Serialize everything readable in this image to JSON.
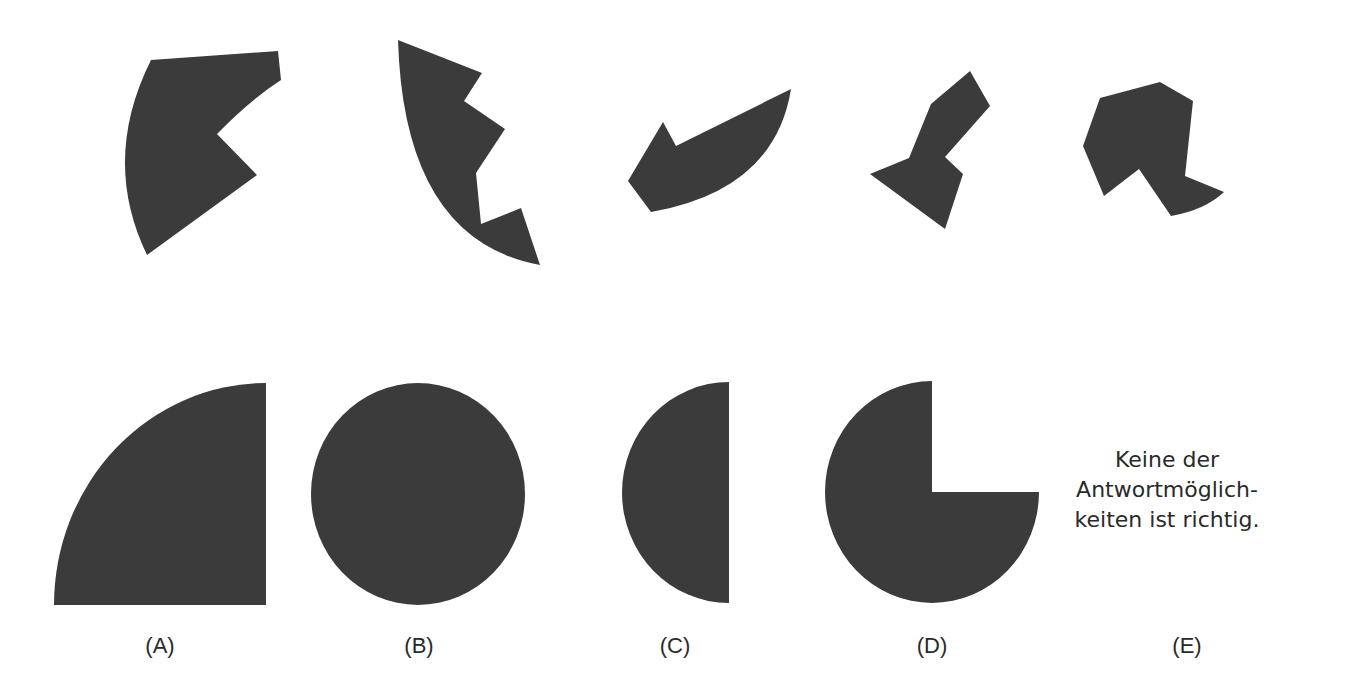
{
  "puzzle": {
    "pieces": [
      {
        "id": "piece-1",
        "description": "sector-shaped piece with notch on right side"
      },
      {
        "id": "piece-2",
        "description": "curved crescent piece with two zigzag notches"
      },
      {
        "id": "piece-3",
        "description": "curved wedge piece with small hook on left"
      },
      {
        "id": "piece-4",
        "description": "angular zigzag polygon piece"
      },
      {
        "id": "piece-5",
        "description": "polygon piece with curved tail at bottom right"
      }
    ]
  },
  "answers": [
    {
      "key": "A",
      "label": "(A)",
      "shape": "quarter-circle"
    },
    {
      "key": "B",
      "label": "(B)",
      "shape": "full-circle"
    },
    {
      "key": "C",
      "label": "(C)",
      "shape": "half-circle"
    },
    {
      "key": "D",
      "label": "(D)",
      "shape": "three-quarter-circle"
    },
    {
      "key": "E",
      "label": "(E)",
      "text_lines": [
        "Keine der",
        "Antwortmöglich-",
        "keiten ist richtig."
      ]
    }
  ],
  "colors": {
    "shape_fill": "#3b3b3b",
    "background": "#ffffff",
    "text": "#2a2a2a"
  }
}
